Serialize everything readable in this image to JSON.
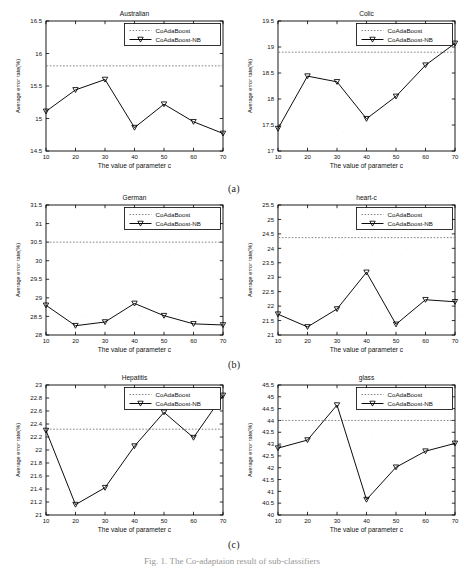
{
  "figure": {
    "caption": "Fig. 1. The Co-adaptaion result of sub-classifiers",
    "subfigure_labels": [
      "(a)",
      "(b)",
      "(c)"
    ],
    "axis": {
      "xlabel": "The value of parameter c",
      "ylabel": "Average error rate(%)"
    },
    "legend": {
      "baseline_label": "CoAdaBoost",
      "series_label": "CoAdaBoost-NB"
    },
    "colors": {
      "line": "#000000",
      "baseline": "#6e6e6e",
      "axis": "#000000",
      "background": "#ffffff"
    }
  },
  "chart_data": [
    {
      "type": "line",
      "title": "Australian",
      "xlabel": "The value of parameter c",
      "ylabel": "Average error rate(%)",
      "x": [
        10,
        20,
        30,
        40,
        50,
        60,
        70
      ],
      "xticks": [
        10,
        20,
        30,
        40,
        50,
        60,
        70
      ],
      "yticks": [
        14.5,
        15,
        15.5,
        16,
        16.5
      ],
      "ytick_labels": [
        "14.5",
        "15",
        "15.5",
        "16",
        "16.5"
      ],
      "xlim": [
        10,
        70
      ],
      "ylim": [
        14.5,
        16.5
      ],
      "grid": false,
      "legend_position": "upper right",
      "series": [
        {
          "name": "CoAdaBoost-NB",
          "style": "solid-marker",
          "values": [
            15.11,
            15.44,
            15.6,
            14.86,
            15.22,
            14.95,
            14.77
          ]
        },
        {
          "name": "CoAdaBoost",
          "style": "dotted-baseline",
          "baseline": 15.81
        }
      ]
    },
    {
      "type": "line",
      "title": "Colic",
      "xlabel": "The value of parameter c",
      "ylabel": "Average error rate(%)",
      "x": [
        10,
        20,
        30,
        40,
        50,
        60,
        70
      ],
      "xticks": [
        10,
        20,
        30,
        40,
        50,
        60,
        70
      ],
      "yticks": [
        17,
        17.5,
        18,
        18.5,
        19,
        19.5
      ],
      "ytick_labels": [
        "17",
        "17.5",
        "18",
        "18.5",
        "19",
        "19.5"
      ],
      "xlim": [
        10,
        70
      ],
      "ylim": [
        17,
        19.5
      ],
      "grid": false,
      "legend_position": "upper right",
      "series": [
        {
          "name": "CoAdaBoost-NB",
          "style": "solid-marker",
          "values": [
            17.43,
            18.44,
            18.33,
            17.62,
            18.05,
            18.65,
            19.07
          ]
        },
        {
          "name": "CoAdaBoost",
          "style": "dotted-baseline",
          "baseline": 18.9
        }
      ]
    },
    {
      "type": "line",
      "title": "German",
      "xlabel": "The value of parameter c",
      "ylabel": "Average error rate(%)",
      "x": [
        10,
        20,
        30,
        40,
        50,
        60,
        70
      ],
      "xticks": [
        10,
        20,
        30,
        40,
        50,
        60,
        70
      ],
      "yticks": [
        28,
        28.5,
        29,
        29.5,
        30,
        30.5,
        31,
        31.5
      ],
      "ytick_labels": [
        "28",
        "28.5",
        "29",
        "29.5",
        "30",
        "30.5",
        "31",
        "31.5"
      ],
      "xlim": [
        10,
        70
      ],
      "ylim": [
        28,
        31.5
      ],
      "grid": false,
      "legend_position": "upper right",
      "series": [
        {
          "name": "CoAdaBoost-NB",
          "style": "solid-marker",
          "values": [
            28.8,
            28.25,
            28.35,
            28.85,
            28.52,
            28.3,
            28.27
          ]
        },
        {
          "name": "CoAdaBoost",
          "style": "dotted-baseline",
          "baseline": 30.5
        }
      ]
    },
    {
      "type": "line",
      "title": "heart-c",
      "xlabel": "The value of parameter c",
      "ylabel": "Average error rate(%)",
      "x": [
        10,
        20,
        30,
        40,
        50,
        60,
        70
      ],
      "xticks": [
        10,
        20,
        30,
        40,
        50,
        60,
        70
      ],
      "yticks": [
        21,
        21.5,
        22,
        22.5,
        23,
        23.5,
        24,
        24.5,
        25,
        25.5
      ],
      "ytick_labels": [
        "21",
        "21.5",
        "22",
        "22.5",
        "23",
        "23.5",
        "24",
        "24.5",
        "25",
        "25.5"
      ],
      "xlim": [
        10,
        70
      ],
      "ylim": [
        21,
        25.5
      ],
      "grid": false,
      "legend_position": "upper right",
      "series": [
        {
          "name": "CoAdaBoost-NB",
          "style": "solid-marker",
          "values": [
            21.72,
            21.28,
            21.9,
            23.17,
            21.37,
            22.22,
            22.15
          ]
        },
        {
          "name": "CoAdaBoost",
          "style": "dotted-baseline",
          "baseline": 24.37
        }
      ]
    },
    {
      "type": "line",
      "title": "Hepatitis",
      "xlabel": "The value of parameter c",
      "ylabel": "Average error rate(%)",
      "x": [
        10,
        20,
        30,
        40,
        50,
        60,
        70
      ],
      "xticks": [
        10,
        20,
        30,
        40,
        50,
        60,
        70
      ],
      "yticks": [
        21,
        21.2,
        21.4,
        21.6,
        21.8,
        22,
        22.2,
        22.4,
        22.6,
        22.8,
        23
      ],
      "ytick_labels": [
        "21",
        "21.2",
        "21.4",
        "21.6",
        "21.8",
        "22",
        "22.2",
        "22.4",
        "22.6",
        "22.8",
        "23"
      ],
      "xlim": [
        10,
        70
      ],
      "ylim": [
        21,
        23
      ],
      "grid": false,
      "legend_position": "upper right",
      "series": [
        {
          "name": "CoAdaBoost-NB",
          "style": "solid-marker",
          "values": [
            22.3,
            21.16,
            21.42,
            22.06,
            22.58,
            22.19,
            22.84
          ]
        },
        {
          "name": "CoAdaBoost",
          "style": "dotted-baseline",
          "baseline": 22.32
        }
      ]
    },
    {
      "type": "line",
      "title": "glass",
      "xlabel": "The value of parameter c",
      "ylabel": "Average error rate(%)",
      "x": [
        10,
        20,
        30,
        40,
        50,
        60,
        70
      ],
      "xticks": [
        10,
        20,
        30,
        40,
        50,
        60,
        70
      ],
      "yticks": [
        40,
        40.5,
        41,
        41.5,
        42,
        42.5,
        43,
        43.5,
        44,
        44.5,
        45,
        45.5
      ],
      "ytick_labels": [
        "40",
        "40.5",
        "41",
        "41.5",
        "42",
        "42.5",
        "43",
        "43.5",
        "44",
        "44.5",
        "45",
        "45.5"
      ],
      "xlim": [
        10,
        70
      ],
      "ylim": [
        40,
        45.5
      ],
      "grid": false,
      "legend_position": "upper right",
      "series": [
        {
          "name": "CoAdaBoost-NB",
          "style": "solid-marker",
          "values": [
            42.83,
            43.17,
            44.65,
            40.65,
            42.02,
            42.7,
            43.03
          ]
        },
        {
          "name": "CoAdaBoost",
          "style": "dotted-baseline",
          "baseline": 44.0
        }
      ]
    }
  ]
}
